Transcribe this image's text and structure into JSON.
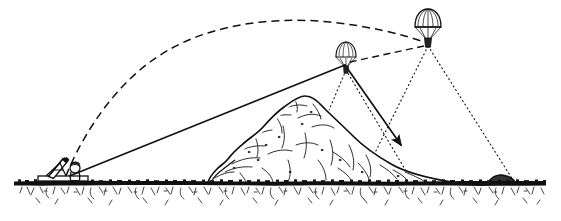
{
  "scene": {
    "title": "Mortar illumination flare diagram",
    "width": 561,
    "height": 221,
    "background_color": "#ffffff",
    "ink_color": "#111111",
    "style": "pen-and-ink line drawing"
  },
  "elements": {
    "ground": {
      "name": "ground-line",
      "label": "Ground surface",
      "baseline_y": 182,
      "band_thickness": 5,
      "grass_depth": 28,
      "description": "Dense stippled horizontal ground band with sketchy grass strokes below"
    },
    "hill": {
      "name": "hill",
      "label": "Hill / rocky mound",
      "peak_x": 305,
      "peak_y": 97,
      "left_base_x": 212,
      "right_base_x": 455,
      "base_y": 182,
      "description": "Large rocky hill blocking direct line of sight, drawn with sketchy interior texture strokes"
    },
    "mortar": {
      "name": "mortar",
      "label": "Mortar with crew",
      "x": 62,
      "y": 176,
      "baseplate_width": 48,
      "tube_angle_deg": 52,
      "description": "Mortar tube on bipod mounted on a baseplate with a crouching soldier figure"
    },
    "trajectory": {
      "name": "shell-trajectory",
      "label": "Shell trajectory",
      "line_style": "dashed",
      "start": [
        66,
        176
      ],
      "apex": [
        330,
        22
      ],
      "end": [
        427,
        42
      ],
      "description": "Dashed ballistic arc from the mortar over the hill to the burst point"
    },
    "descent_path": {
      "name": "flare-descent-path",
      "label": "Flare descent path",
      "line_style": "dashed",
      "start": [
        427,
        45
      ],
      "end": [
        347,
        64
      ],
      "description": "Dashed line showing the first flare drifting down from the burst point"
    },
    "line_of_sight": {
      "name": "line-of-sight",
      "label": "Observer line of sight",
      "line_style": "solid",
      "start": [
        66,
        177
      ],
      "end": [
        404,
        146
      ],
      "arrow_at_end": true,
      "description": "Straight solid sight line from the mortar position past the flare to the target slope"
    },
    "flares": [
      {
        "name": "flare-left",
        "label": "Illumination flare (descending)",
        "x": 346,
        "y": 58,
        "canopy_width": 20,
        "size": "small",
        "cone_left_x": 300,
        "cone_right_x": 410,
        "cone_ground_y": 180
      },
      {
        "name": "flare-right",
        "label": "Illumination flare (burst point)",
        "x": 428,
        "y": 28,
        "canopy_width": 26,
        "size": "large",
        "cone_left_x": 360,
        "cone_right_x": 512,
        "cone_ground_y": 180
      }
    ],
    "light_cones": {
      "name": "light-cone",
      "label": "Illuminated area",
      "line_style": "dotted",
      "count": 2,
      "description": "Dotted cones of light projected downward from each parachute flare onto the ground"
    }
  }
}
